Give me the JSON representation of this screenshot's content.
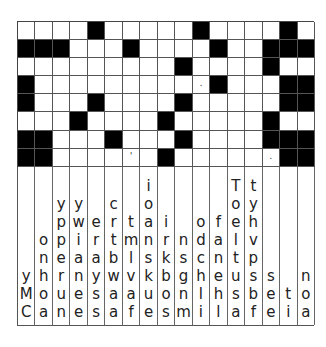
{
  "puzzle": {
    "type": "drop-quote",
    "columns": 17,
    "rows": 8,
    "grid": [
      "....#.....#....#.",
      "###...#....#..###",
      ".........#....#..",
      "#..........#...##",
      "#...#....#.....##",
      "...#....#.....#..",
      "##...#...#....###",
      "##......#......##"
    ],
    "punctuation": [
      {
        "row": 4,
        "col": 11,
        "char": "."
      },
      {
        "row": 8,
        "col": 7,
        "char": "'"
      },
      {
        "row": 8,
        "col": 15,
        "char": "."
      }
    ],
    "clue_columns": [
      [
        "y",
        "M",
        "C"
      ],
      [
        "o",
        "n",
        "h",
        "o",
        "a"
      ],
      [
        "y",
        "p",
        "p",
        "e",
        "r",
        "u",
        "n"
      ],
      [
        "y",
        "w",
        "i",
        "a",
        "n",
        "e",
        "e"
      ],
      [
        "e",
        "r",
        "a",
        "y",
        "s",
        "s"
      ],
      [
        "c",
        "r",
        "t",
        "b",
        "w",
        "a",
        "a"
      ],
      [
        "t",
        "m",
        "l",
        "v",
        "a",
        "f"
      ],
      [
        "i",
        "o",
        "a",
        "n",
        "s",
        "k",
        "u",
        "e"
      ],
      [
        "i",
        "r",
        "k",
        "b",
        "o",
        "s"
      ],
      [
        "n",
        "s",
        "g",
        "n",
        "m"
      ],
      [
        "o",
        "d",
        "c",
        "h",
        "l",
        "i"
      ],
      [
        "f",
        "a",
        "n",
        "e",
        "h",
        "l"
      ],
      [
        "T",
        "o",
        "e",
        "l",
        "t",
        "u",
        "s",
        "a"
      ],
      [
        "t",
        "y",
        "h",
        "v",
        "p",
        "s",
        "b",
        "f"
      ],
      [
        "s",
        "e",
        "e"
      ],
      [
        "t",
        "i"
      ],
      [
        "n",
        "o",
        "a"
      ]
    ]
  }
}
